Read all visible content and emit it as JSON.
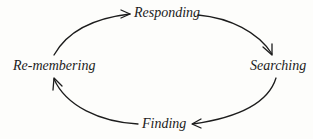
{
  "diagram": {
    "type": "cycle",
    "direction": "clockwise",
    "nodes": [
      {
        "id": "responding",
        "label": "Responding"
      },
      {
        "id": "searching",
        "label": "Searching"
      },
      {
        "id": "finding",
        "label": "Finding"
      },
      {
        "id": "remembering",
        "label": "Re-membering"
      }
    ],
    "edges": [
      {
        "from": "remembering",
        "to": "responding"
      },
      {
        "from": "responding",
        "to": "searching"
      },
      {
        "from": "searching",
        "to": "finding"
      },
      {
        "from": "finding",
        "to": "remembering"
      }
    ],
    "colors": {
      "ink": "#1c1c1c",
      "background": "#fdfdfb"
    }
  }
}
